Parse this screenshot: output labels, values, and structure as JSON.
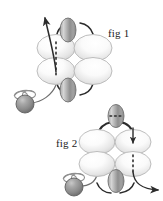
{
  "figure": {
    "background_color": "#ffffff",
    "width": 163,
    "height": 201,
    "caption_font": "serif",
    "panels": [
      {
        "id": "fig1",
        "label": "fig 1",
        "label_x": 108,
        "label_y": 37,
        "axis_orientation": "vertical",
        "dashed_axis_column": "left",
        "arrow_direction": "up-left",
        "description": "Four light lobes in a 2x2 arrangement with dark axial lobes above and below, dashed vertical axis through left column, curved arrow exiting upper-left, shaded sphere with coil at lower-left"
      },
      {
        "id": "fig2",
        "label": "fig 2",
        "label_x": 56,
        "label_y": 147,
        "axis_orientation": "vertical",
        "dashed_axis_column": "right",
        "arrow_direction": "down-right",
        "description": "Four light lobes in a 2x2 arrangement with dark axial lobes above and below, dashed vertical axis through right column plus horizontal dashes in top lobe, arrowhead entering right lobe, curved arrow exiting lower-right, shaded sphere with coil at lower-left"
      }
    ],
    "colors": {
      "lobe_light_fill": "#f2f2f2",
      "lobe_light_edge": "#b8b8b8",
      "lobe_dark_fill": "#9e9e9e",
      "lobe_dark_edge": "#6d6d6d",
      "sphere_fill": "#8c8c8c",
      "sphere_edge": "#5a5a5a",
      "stroke_dark": "#2b2b2b",
      "dash_color": "#2b2b2b",
      "label_color": "#1a1a1a"
    },
    "elements": {
      "lobe_light_count": 8,
      "lobe_dark_count": 4,
      "sphere_count": 2,
      "arrow_count": 3,
      "dashed_axis_count": 3
    }
  }
}
